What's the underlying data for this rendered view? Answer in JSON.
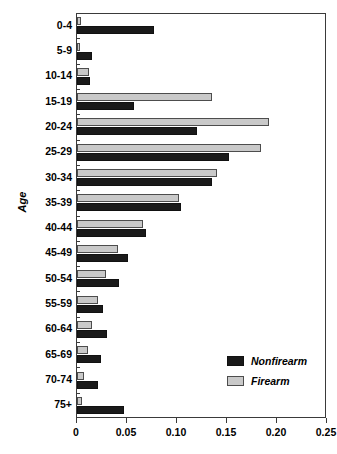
{
  "chart_data": {
    "type": "bar",
    "orientation": "horizontal",
    "title": "",
    "xlabel": "",
    "ylabel": "Age",
    "xlim": [
      0,
      0.25
    ],
    "xticks": [
      "0",
      "0.05",
      "0.10",
      "0.15",
      "0.20",
      "0.25"
    ],
    "xtick_values": [
      0,
      0.05,
      0.1,
      0.15,
      0.2,
      0.25
    ],
    "grid": false,
    "legend_position": "lower-right",
    "categories": [
      "0-4",
      "5-9",
      "10-14",
      "15-19",
      "20-24",
      "25-29",
      "30-34",
      "35-39",
      "40-44",
      "45-49",
      "50-54",
      "55-59",
      "60-64",
      "65-69",
      "70-74",
      "75+"
    ],
    "series": [
      {
        "name": "Nonfirearm",
        "color": "#1a1a1a",
        "values": [
          0.077,
          0.015,
          0.013,
          0.057,
          0.12,
          0.152,
          0.135,
          0.104,
          0.069,
          0.051,
          0.042,
          0.026,
          0.03,
          0.024,
          0.021,
          0.047
        ]
      },
      {
        "name": "Firearm",
        "color": "#c9c9c9",
        "values": [
          0.004,
          0.003,
          0.012,
          0.135,
          0.192,
          0.184,
          0.14,
          0.102,
          0.066,
          0.041,
          0.029,
          0.021,
          0.015,
          0.011,
          0.007,
          0.005
        ]
      }
    ]
  },
  "legend": {
    "items": [
      {
        "label": "Nonfirearm",
        "swatch": "nonfirearm"
      },
      {
        "label": "Firearm",
        "swatch": "firearm"
      }
    ]
  }
}
